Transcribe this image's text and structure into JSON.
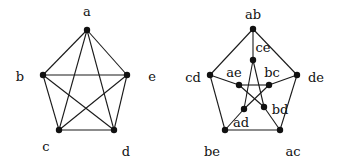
{
  "colors": {
    "edge": "#1a1a1a",
    "node": "#111111",
    "background": "#ffffff"
  },
  "graphs": [
    {
      "name": "K5",
      "nodes": [
        {
          "id": "a",
          "label": "a",
          "x": 87,
          "y": 30,
          "lx": 87,
          "ly": 16
        },
        {
          "id": "b",
          "label": "b",
          "x": 43,
          "y": 75,
          "lx": 20,
          "ly": 81
        },
        {
          "id": "e",
          "label": "e",
          "x": 127,
          "y": 75,
          "lx": 152,
          "ly": 81
        },
        {
          "id": "c",
          "label": "c",
          "x": 59,
          "y": 130,
          "lx": 46,
          "ly": 151
        },
        {
          "id": "d",
          "label": "d",
          "x": 114,
          "y": 130,
          "lx": 126,
          "ly": 156
        }
      ],
      "edges": [
        [
          "a",
          "b"
        ],
        [
          "a",
          "c"
        ],
        [
          "a",
          "d"
        ],
        [
          "a",
          "e"
        ],
        [
          "b",
          "c"
        ],
        [
          "b",
          "d"
        ],
        [
          "b",
          "e"
        ],
        [
          "c",
          "d"
        ],
        [
          "c",
          "e"
        ],
        [
          "d",
          "e"
        ]
      ]
    },
    {
      "name": "Petersen",
      "nodes": [
        {
          "id": "ab",
          "label": "ab",
          "x": 253,
          "y": 29,
          "lx": 253,
          "ly": 19
        },
        {
          "id": "ce",
          "label": "ce",
          "x": 253,
          "y": 60,
          "lx": 263,
          "ly": 52
        },
        {
          "id": "cd",
          "label": "cd",
          "x": 210,
          "y": 75,
          "lx": 193,
          "ly": 82
        },
        {
          "id": "de",
          "label": "de",
          "x": 297,
          "y": 75,
          "lx": 316,
          "ly": 82
        },
        {
          "id": "ae",
          "label": "ae",
          "x": 239,
          "y": 85,
          "lx": 234,
          "ly": 77
        },
        {
          "id": "bc",
          "label": "bc",
          "x": 269,
          "y": 85,
          "lx": 272,
          "ly": 77
        },
        {
          "id": "ad",
          "label": "ad",
          "x": 244,
          "y": 109,
          "lx": 241,
          "ly": 127
        },
        {
          "id": "bd",
          "label": "bd",
          "x": 264,
          "y": 107,
          "lx": 280,
          "ly": 114
        },
        {
          "id": "be",
          "label": "be",
          "x": 225,
          "y": 130,
          "lx": 212,
          "ly": 156
        },
        {
          "id": "ac",
          "label": "ac",
          "x": 280,
          "y": 130,
          "lx": 293,
          "ly": 156
        }
      ],
      "edges": [
        [
          "ab",
          "de"
        ],
        [
          "de",
          "ac"
        ],
        [
          "ac",
          "be"
        ],
        [
          "be",
          "cd"
        ],
        [
          "cd",
          "ab"
        ],
        [
          "ab",
          "ce"
        ],
        [
          "de",
          "bc"
        ],
        [
          "ac",
          "bd"
        ],
        [
          "be",
          "ad"
        ],
        [
          "cd",
          "ae"
        ],
        [
          "ce",
          "ad"
        ],
        [
          "ce",
          "bd"
        ],
        [
          "ae",
          "bc"
        ],
        [
          "ae",
          "bd"
        ],
        [
          "bc",
          "ad"
        ]
      ]
    }
  ]
}
